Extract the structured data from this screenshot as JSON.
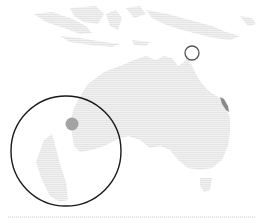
{
  "map": {
    "width": 260,
    "height": 223,
    "colors": {
      "background": "#ffffff",
      "land": "#eeeeee",
      "land_hatch": "#e2e2e2",
      "marker_fill": "#a3a3a3",
      "region_fill": "#8a8a8a",
      "ring_stroke": "#555555",
      "inset_stroke": "#1a1a1a",
      "baseline": "#c8c8c8"
    },
    "regions": [
      {
        "name": "Australia",
        "kind": "landmass"
      },
      {
        "name": "Tasmania",
        "kind": "landmass"
      },
      {
        "name": "New Guinea",
        "kind": "landmass"
      },
      {
        "name": "Indonesia",
        "kind": "landmass"
      }
    ],
    "markers": [
      {
        "id": "ring-marker",
        "shape": "hollow-circle",
        "cx": 192,
        "cy": 53,
        "r": 7
      },
      {
        "id": "inset-dot",
        "shape": "filled-circle",
        "cx": 72,
        "cy": 124,
        "r": 6.5
      },
      {
        "id": "east-coast-highlight",
        "shape": "filled-region",
        "cx": 224,
        "cy": 104
      }
    ],
    "inset": {
      "shape": "circle",
      "cx": 66,
      "cy": 151,
      "r": 55
    },
    "baseline": {
      "y": 217,
      "x1": 8,
      "x2": 255,
      "style": "dotted"
    }
  }
}
